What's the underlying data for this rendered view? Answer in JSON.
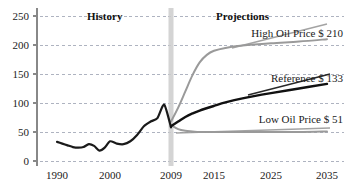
{
  "chart_data": {
    "type": "line",
    "title": "",
    "subtitle": "",
    "xlabel": "",
    "ylabel": "",
    "xlim": [
      1990,
      2035
    ],
    "ylim": [
      0,
      250
    ],
    "grid": true,
    "grid_style": "dashed-horizontal",
    "legend_position": "inline-right-annotations",
    "x_ticks": [
      "1990",
      "2000",
      "2009",
      "2015",
      "2025",
      "2035"
    ],
    "x_tick_values": [
      1990,
      2000,
      2009,
      2015,
      2025,
      2035
    ],
    "y_ticks": [
      "0",
      "50",
      "100",
      "150",
      "200",
      "250"
    ],
    "y_tick_values": [
      0,
      50,
      100,
      150,
      200,
      250
    ],
    "divider_year": 2009,
    "period_labels": [
      {
        "text": "History",
        "x": 1999
      },
      {
        "text": "Projections",
        "x": 2020
      }
    ],
    "series": [
      {
        "name": "History",
        "color": "#1a1a1a",
        "width": 2.2,
        "x": [
          1990,
          1991,
          1992,
          1993,
          1994,
          1995,
          1996,
          1997,
          1998,
          1999,
          2000,
          2001,
          2002,
          2003,
          2004,
          2005,
          2006,
          2007,
          2008,
          2009
        ],
        "values": [
          33,
          30,
          27,
          24,
          23,
          24,
          29,
          26,
          18,
          23,
          34,
          30,
          29,
          34,
          45,
          60,
          68,
          74,
          97,
          58
        ]
      },
      {
        "name": "High Oil Price",
        "label": "High Oil Price $ 210",
        "color": "#9a9a9a",
        "width": 2.0,
        "end_value": 210,
        "x": [
          2009,
          2010,
          2011,
          2012,
          2013,
          2014,
          2015,
          2017,
          2020,
          2025,
          2030,
          2035
        ],
        "values": [
          68,
          92,
          120,
          148,
          170,
          183,
          190,
          195,
          199,
          203,
          206,
          210
        ]
      },
      {
        "name": "Reference",
        "label": "Reference $ 133",
        "color": "#111111",
        "width": 2.4,
        "end_value": 133,
        "x": [
          2009,
          2010,
          2011,
          2012,
          2013,
          2015,
          2017,
          2020,
          2025,
          2030,
          2035
        ],
        "values": [
          60,
          68,
          76,
          82,
          87,
          95,
          101,
          108,
          117,
          125,
          133
        ]
      },
      {
        "name": "Low Oil Price",
        "label": "Low Oil Price $ 51",
        "color": "#9a9a9a",
        "width": 2.0,
        "end_value": 51,
        "x": [
          2009,
          2010,
          2011,
          2012,
          2013,
          2015,
          2020,
          2025,
          2030,
          2035
        ],
        "values": [
          62,
          55,
          52,
          51,
          50,
          50,
          50,
          50,
          50,
          51
        ]
      }
    ],
    "annotations": [
      {
        "name": "high-oil-price-annotation",
        "text": "High Oil Price $ 210"
      },
      {
        "name": "reference-annotation",
        "text": "Reference $ 133"
      },
      {
        "name": "low-oil-price-annotation",
        "text": "Low Oil Price $ 51"
      }
    ],
    "colors": {
      "axis": "#888888",
      "grid": "#9aa0b0",
      "history_line": "#1a1a1a",
      "reference_line": "#111111",
      "high_low_line": "#9a9a9a",
      "divider_band": "#cccccc",
      "background": "#ffffff"
    }
  }
}
